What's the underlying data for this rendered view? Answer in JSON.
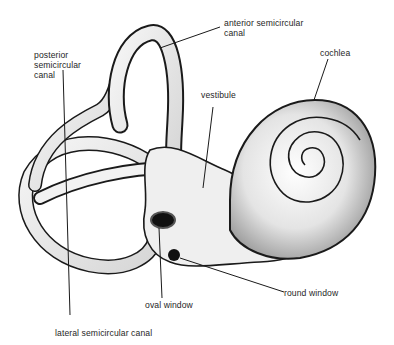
{
  "diagram": {
    "labels": {
      "posterior_line1": "posterior",
      "posterior_line2": "semicircular",
      "posterior_line3": "canal",
      "anterior_line1": "anterior semicircular",
      "anterior_line2": "canal",
      "cochlea": "cochlea",
      "vestibule": "vestibule",
      "oval_window": "oval window",
      "round_window": "round window",
      "lateral": "lateral semicircular canal"
    },
    "colors": {
      "background": "#ffffff",
      "ink": "#1a1a1a",
      "shade": "#8a8a8a",
      "fill": "#eeeeee"
    }
  }
}
